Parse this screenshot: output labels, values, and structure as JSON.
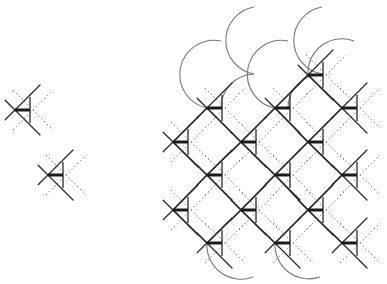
{
  "diagram": {
    "title": "",
    "colors": {
      "background": "#ffffff",
      "solid_line": "#2a2a2a",
      "dotted_line": "#8a8a8a",
      "arc": "#777777"
    },
    "motif": {
      "description": "Crossing solid lines with a triangle (vertical edge + thick horizontal bar) and dotted crossing lines offset to the right",
      "arm": 14,
      "tri_offset": 15,
      "tri_half": 13,
      "dot_offset": 18,
      "dot_arm": 20
    },
    "isolated_motifs": [
      {
        "x": 15,
        "y": 110
      },
      {
        "x": 48,
        "y": 175
      }
    ],
    "lattice_nodes": [
      {
        "x": 308,
        "y": 75
      },
      {
        "x": 207,
        "y": 108
      },
      {
        "x": 275,
        "y": 108
      },
      {
        "x": 342,
        "y": 108
      },
      {
        "x": 173,
        "y": 142
      },
      {
        "x": 241,
        "y": 142
      },
      {
        "x": 308,
        "y": 142
      },
      {
        "x": 207,
        "y": 175
      },
      {
        "x": 275,
        "y": 175
      },
      {
        "x": 342,
        "y": 175
      },
      {
        "x": 173,
        "y": 210
      },
      {
        "x": 241,
        "y": 210
      },
      {
        "x": 308,
        "y": 210
      },
      {
        "x": 207,
        "y": 243
      },
      {
        "x": 275,
        "y": 243
      },
      {
        "x": 342,
        "y": 243
      }
    ],
    "arcs": [
      {
        "d": "M254,7 A34,34 0 0 0 254,74"
      },
      {
        "d": "M221,41 A34,34 0 0 0 207,108"
      },
      {
        "d": "M254,74 A34,34 0 0 0 221,108"
      },
      {
        "d": "M322,7 A34,34 0 0 0 322,74"
      },
      {
        "d": "M288,41 A34,34 0 0 0 275,108"
      },
      {
        "d": "M322,74 A34,34 0 0 0 288,108"
      },
      {
        "d": "M354,41 A34,34 0 0 0 308,75"
      },
      {
        "d": "M207,243 A34,34 0 0 0 253,277"
      },
      {
        "d": "M275,243 A34,34 0 0 0 320,277"
      }
    ]
  }
}
